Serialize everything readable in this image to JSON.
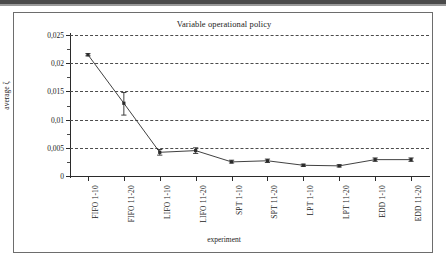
{
  "chart_data": {
    "type": "line",
    "title": "Variable operational policy",
    "xlabel": "experiment",
    "ylabel": "average ζ",
    "categories": [
      "FIFO 1-10",
      "FIFO 11-20",
      "LIFO 1-10",
      "LIFO 11-20",
      "SPT 1-10",
      "SPT 11-20",
      "LPT 1-10",
      "LPT 11-20",
      "EDD 1-10",
      "EDD 11-20"
    ],
    "values": [
      0.0215,
      0.0129,
      0.0042,
      0.0045,
      0.0025,
      0.0027,
      0.0019,
      0.0018,
      0.0029,
      0.0029
    ],
    "error_low": [
      0.0213,
      0.0108,
      0.0037,
      0.004,
      0.0023,
      0.0024,
      0.0017,
      0.0016,
      0.0026,
      0.0026
    ],
    "error_high": [
      0.0217,
      0.0148,
      0.0047,
      0.005,
      0.0028,
      0.003,
      0.0021,
      0.002,
      0.0032,
      0.0032
    ],
    "ylim": [
      0,
      0.025
    ],
    "ytick_labels": [
      "0,025",
      "0,02",
      "0,015",
      "0,01",
      "0,005",
      "0"
    ],
    "ytick_values": [
      0.025,
      0.02,
      0.015,
      0.01,
      0.005,
      0
    ],
    "grid": "horizontal-dashed",
    "legend": "none",
    "marker": "square",
    "line_color": "#2b2b2b",
    "grid_color": "#4b4b4b",
    "axis_color": "#2b2b2b"
  }
}
